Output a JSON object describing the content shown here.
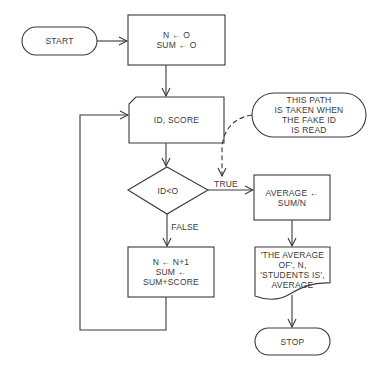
{
  "diagram": {
    "type": "flowchart",
    "stroke_color": "#3a3a3a",
    "background": "#ffffff",
    "nodes": {
      "start": {
        "shape": "terminal",
        "lines": [
          "START"
        ]
      },
      "init": {
        "shape": "process",
        "lines": [
          "N ← O",
          "SUM ← O"
        ]
      },
      "input": {
        "shape": "input-card",
        "lines": [
          "ID, SCORE"
        ]
      },
      "decision": {
        "shape": "decision",
        "lines": [
          "ID<O"
        ]
      },
      "accumulate": {
        "shape": "process",
        "lines": [
          "N ← N+1",
          "SUM ←",
          "SUM+SCORE"
        ]
      },
      "average": {
        "shape": "process",
        "lines": [
          "AVERAGE ←",
          "SUM/N"
        ]
      },
      "output": {
        "shape": "document",
        "lines": [
          "'THE AVERAGE",
          "OF', N,",
          "'STUDENTS IS',",
          "AVERAGE"
        ]
      },
      "stop": {
        "shape": "terminal",
        "lines": [
          "STOP"
        ]
      },
      "note": {
        "shape": "annotation",
        "lines": [
          "THIS PATH",
          "IS TAKEN WHEN",
          "THE FAKE ID",
          "IS READ"
        ]
      }
    },
    "edge_labels": {
      "true": "TRUE",
      "false": "FALSE"
    },
    "edges": [
      {
        "from": "start",
        "to": "init"
      },
      {
        "from": "init",
        "to": "input"
      },
      {
        "from": "input",
        "to": "decision"
      },
      {
        "from": "decision",
        "to": "average",
        "label": "TRUE"
      },
      {
        "from": "decision",
        "to": "accumulate",
        "label": "FALSE"
      },
      {
        "from": "accumulate",
        "to": "input",
        "style": "loop"
      },
      {
        "from": "average",
        "to": "output"
      },
      {
        "from": "output",
        "to": "stop"
      },
      {
        "from": "note",
        "to": "true-edge",
        "style": "dashed"
      }
    ]
  }
}
